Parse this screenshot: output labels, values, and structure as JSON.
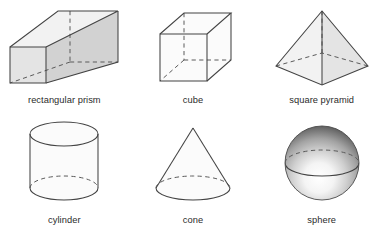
{
  "figure": {
    "background_color": "#ffffff",
    "layout": {
      "columns": 3,
      "rows": 2
    },
    "stroke_color": "#434343",
    "hidden_edge_color": "#5a5a5a",
    "label_color": "#2b2b2b"
  },
  "shapes": [
    {
      "id": "rectangular-prism",
      "label": "rectangular prism",
      "row": 1,
      "column": 1,
      "kind": "polyhedron",
      "faces_shaded": true,
      "hidden_edges": "dashed",
      "face_colors": {
        "front": "#e8e8e8",
        "side": "#d2d2d2",
        "top": "#f2f2f2"
      }
    },
    {
      "id": "cube",
      "label": "cube",
      "row": 1,
      "column": 2,
      "kind": "polyhedron",
      "faces_shaded": false,
      "hidden_edges": "dashed",
      "face_colors": {
        "front": "#fbfbfb",
        "side": "#fbfbfb",
        "top": "#fbfbfb"
      }
    },
    {
      "id": "square-pyramid",
      "label": "square pyramid",
      "row": 1,
      "column": 3,
      "kind": "polyhedron",
      "faces_shaded": true,
      "hidden_edges": "dashed",
      "face_colors": {
        "front": "#f2f2f2",
        "side": "#e7e7e7"
      }
    },
    {
      "id": "cylinder",
      "label": "cylinder",
      "row": 2,
      "column": 1,
      "kind": "solid-of-revolution",
      "faces_shaded": false,
      "hidden_edges": "dashed",
      "face_colors": {
        "body": "#fbfbfb",
        "top": "#fafafa"
      }
    },
    {
      "id": "cone",
      "label": "cone",
      "row": 2,
      "column": 2,
      "kind": "solid-of-revolution",
      "faces_shaded": false,
      "hidden_edges": "dashed",
      "face_colors": {
        "body": "#f7f7f7",
        "base": "#efefef"
      }
    },
    {
      "id": "sphere",
      "label": "sphere",
      "row": 2,
      "column": 3,
      "kind": "solid-of-revolution",
      "faces_shaded": true,
      "hidden_edges": "dashed",
      "face_colors": {
        "highlight": "#ffffff",
        "midtone": "#9a9a9a",
        "shadow": "#3d3d3d"
      }
    }
  ]
}
